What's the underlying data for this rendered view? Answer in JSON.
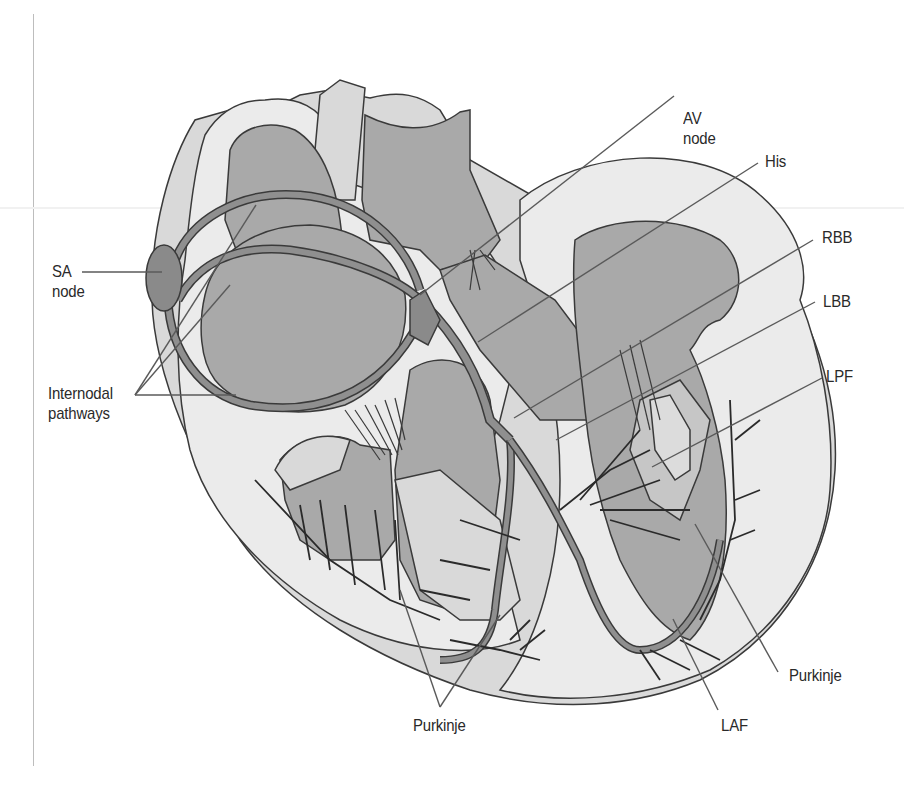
{
  "figure": {
    "colors": {
      "background": "#ffffff",
      "outer_wall": "#d9d9d9",
      "inner_wall": "#ebebeb",
      "chamber": "#a9a9a9",
      "conduction": "#8f8f8f",
      "node": "#8a8a8a",
      "outline": "#3a3a3a",
      "leader": "#5a5a5a",
      "text": "#2a2a2a"
    }
  },
  "labels": {
    "av_node": {
      "line1": "AV",
      "line2": "node"
    },
    "his": "His",
    "rbb": "RBB",
    "lbb": "LBB",
    "lpf": "LPF",
    "purkinje_right": "Purkinje",
    "purkinje_left": "Purkinje",
    "laf": "LAF",
    "sa_node": {
      "line1": "SA",
      "line2": "node"
    },
    "internodal": {
      "line1": "Internodal",
      "line2": "pathways"
    }
  }
}
